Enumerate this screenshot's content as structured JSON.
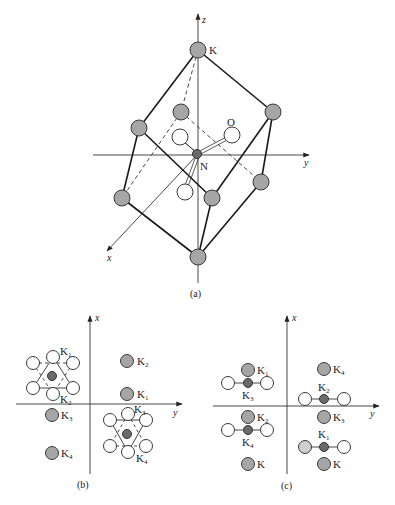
{
  "panel_a": {
    "caption": "(a)",
    "axes": {
      "x": "x",
      "y": "y",
      "z": "z"
    },
    "labels": {
      "K": "K",
      "O": "O",
      "N": "N"
    }
  },
  "panel_b": {
    "caption": "(b)",
    "axes": {
      "x": "x",
      "y": "y"
    },
    "labels": [
      {
        "base": "K",
        "sub": "1",
        "id": "cluster1-K1"
      },
      {
        "base": "K",
        "sub": "2",
        "id": "cluster1-K2"
      },
      {
        "base": "K",
        "sub": "2",
        "id": "right-K2"
      },
      {
        "base": "K",
        "sub": "1",
        "id": "right-K1"
      },
      {
        "base": "K",
        "sub": "3",
        "id": "left-K3"
      },
      {
        "base": "K",
        "sub": "4",
        "id": "left-K4"
      },
      {
        "base": "K",
        "sub": "3",
        "id": "cluster2-K3"
      },
      {
        "base": "K",
        "sub": "4",
        "id": "cluster2-K4"
      }
    ]
  },
  "panel_c": {
    "caption": "(c)",
    "axes": {
      "x": "x",
      "y": "y"
    },
    "labels": [
      {
        "base": "K",
        "sub": "1",
        "id": "ul-K1"
      },
      {
        "base": "K",
        "sub": "3",
        "id": "ul-K3"
      },
      {
        "base": "K",
        "sub": "2",
        "id": "ll-K2"
      },
      {
        "base": "K",
        "sub": "4",
        "id": "ll-K4"
      },
      {
        "base": "K",
        "sub": "",
        "id": "ll-K"
      },
      {
        "base": "K",
        "sub": "4",
        "id": "ur-K4"
      },
      {
        "base": "K",
        "sub": "2",
        "id": "ur-K2"
      },
      {
        "base": "K",
        "sub": "3",
        "id": "ur-K3"
      },
      {
        "base": "K",
        "sub": "1",
        "id": "lr-K1"
      },
      {
        "base": "K",
        "sub": "",
        "id": "lr-K"
      }
    ]
  },
  "colors": {
    "K_atom": "#a6a6a6",
    "N_atom": "#6b6b6b",
    "O_atom": "#ffffff",
    "light_atom": "#cfcfcf"
  }
}
